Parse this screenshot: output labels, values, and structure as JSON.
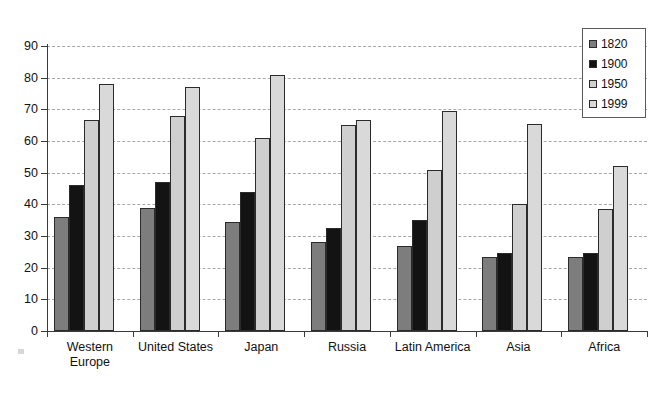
{
  "chart_data": {
    "type": "bar",
    "title": "",
    "subtitle": "",
    "xlabel": "",
    "ylabel": "",
    "ylim": [
      0,
      90
    ],
    "ytick_step": 10,
    "yticks": [
      90,
      80,
      70,
      60,
      50,
      40,
      30,
      20,
      10,
      0
    ],
    "grid": true,
    "grid_orientation": "horizontal",
    "legend_position": "top-right",
    "categories": [
      "Western\nEurope",
      "United States",
      "Japan",
      "Russia",
      "Latin America",
      "Asia",
      "Africa"
    ],
    "series": [
      {
        "name": "1820",
        "color": "#7d7d7d",
        "values": [
          36,
          39,
          34.5,
          28,
          27,
          23.5,
          23.5
        ]
      },
      {
        "name": "1900",
        "color": "#131313",
        "values": [
          46,
          47,
          44,
          32.5,
          35,
          24.5,
          24.5
        ]
      },
      {
        "name": "1950",
        "color": "#cfcfcf",
        "values": [
          66.5,
          68,
          61,
          65,
          51,
          40,
          38.5
        ]
      },
      {
        "name": "1999",
        "color": "#d9d9d9",
        "values": [
          78,
          77,
          81,
          66.5,
          69.5,
          65.5,
          52
        ]
      }
    ]
  },
  "legend": {
    "items": [
      {
        "label": "1820"
      },
      {
        "label": "1900"
      },
      {
        "label": "1950"
      },
      {
        "label": "1999"
      }
    ]
  },
  "colors": {
    "series_1820": "#7d7d7d",
    "series_1900": "#131313",
    "series_1950": "#cfcfcf",
    "series_1999": "#d9d9d9",
    "axis": "#3a3a3a",
    "gridline": "#9a9a9a",
    "background": "#ffffff"
  }
}
